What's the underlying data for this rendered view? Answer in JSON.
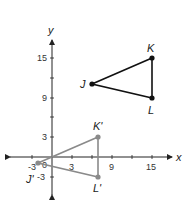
{
  "diagram": {
    "axes": {
      "x_label": "x",
      "y_label": "y"
    },
    "ticks": {
      "x": [
        {
          "value": -3,
          "label": "-3"
        },
        {
          "value": 3,
          "label": "3"
        },
        {
          "value": 9,
          "label": "9"
        },
        {
          "value": 15,
          "label": "15"
        }
      ],
      "y": [
        {
          "value": 15,
          "label": "15"
        },
        {
          "value": 9,
          "label": "9"
        },
        {
          "value": 3,
          "label": "3"
        },
        {
          "value": -3,
          "label": "-3"
        }
      ],
      "origin_label": "0"
    },
    "original_triangle": {
      "color": "#111111",
      "points": [
        {
          "name": "J",
          "x": 6,
          "y": 11
        },
        {
          "name": "K",
          "x": 15,
          "y": 15
        },
        {
          "name": "L",
          "x": 15,
          "y": 9
        }
      ]
    },
    "image_triangle": {
      "color": "#8a8a8a",
      "points": [
        {
          "name": "J'",
          "x": -2,
          "y": -1
        },
        {
          "name": "K'",
          "x": 7,
          "y": 3
        },
        {
          "name": "L'",
          "x": 7,
          "y": -3
        }
      ]
    }
  }
}
